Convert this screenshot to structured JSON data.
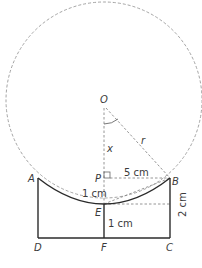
{
  "diagram": {
    "points": {
      "O": {
        "label": "O",
        "x": 104,
        "y": 100
      },
      "P": {
        "label": "P",
        "x": 104,
        "y": 178
      },
      "A": {
        "label": "A",
        "x": 38,
        "y": 178
      },
      "B": {
        "label": "B",
        "x": 170,
        "y": 178
      },
      "E": {
        "label": "E",
        "x": 104,
        "y": 204
      },
      "F": {
        "label": "F",
        "x": 104,
        "y": 238
      },
      "D": {
        "label": "D",
        "x": 38,
        "y": 238
      },
      "C": {
        "label": "C",
        "x": 170,
        "y": 238
      }
    },
    "labels": {
      "x": "x",
      "r": "r",
      "pb": "5 cm",
      "pe": "1 cm",
      "ef": "1 cm",
      "bc": "2 cm"
    },
    "colors": {
      "solid": "#2b2b2b",
      "dashed": "#9a9a9a"
    }
  }
}
